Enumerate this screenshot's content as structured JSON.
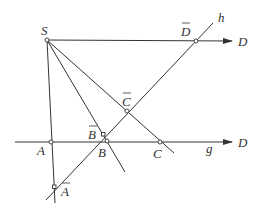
{
  "diagram": {
    "type": "projective-geometry-construction",
    "labels": {
      "S": "S",
      "D_top": "D",
      "D_bar": "D",
      "h": "h",
      "C_bar": "C",
      "B_bar": "B",
      "B": "B",
      "A": "A",
      "C": "C",
      "g": "g",
      "D_bottom": "D",
      "A_bar": "A"
    },
    "points": {
      "S": [
        47,
        40
      ],
      "D_bar": [
        196,
        41
      ],
      "C_bar": [
        127,
        111
      ],
      "B_bar": [
        103,
        134
      ],
      "B": [
        107,
        141
      ],
      "A": [
        51,
        142
      ],
      "C": [
        160,
        142
      ],
      "A_bar": [
        54,
        187
      ]
    },
    "lines": [
      {
        "name": "SD",
        "from": [
          47,
          40
        ],
        "to": [
          232,
          41
        ],
        "arrow": true
      },
      {
        "name": "g",
        "from": [
          15,
          142
        ],
        "to": [
          232,
          142
        ],
        "arrow": true
      },
      {
        "name": "h",
        "from": [
          46,
          200
        ],
        "to": [
          213,
          23
        ]
      },
      {
        "name": "SA",
        "from": [
          47,
          40
        ],
        "to": [
          55,
          203
        ]
      },
      {
        "name": "SB",
        "from": [
          47,
          40
        ],
        "to": [
          125,
          172
        ]
      },
      {
        "name": "SC",
        "from": [
          47,
          40
        ],
        "to": [
          174,
          153
        ]
      }
    ],
    "colors": {
      "stroke": "#333333",
      "background": "#ffffff"
    }
  }
}
